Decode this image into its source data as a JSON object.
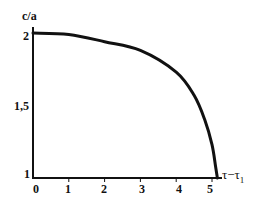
{
  "chart_data": {
    "type": "line",
    "title": "",
    "xlabel": "τ−τ1",
    "ylabel": "c/a",
    "xlim": [
      0,
      5.3
    ],
    "ylim": [
      1,
      2
    ],
    "x_ticks": [
      "0",
      "1",
      "2",
      "3",
      "4",
      "5"
    ],
    "y_ticks": [
      "1",
      "1,5",
      "2"
    ],
    "grid": false,
    "legend": null,
    "series": [
      {
        "name": "c/a",
        "color": "#111111",
        "x": [
          0,
          1,
          2,
          3,
          4,
          4.5,
          4.8,
          5.0,
          5.1,
          5.15
        ],
        "y": [
          2.0,
          1.99,
          1.94,
          1.88,
          1.73,
          1.57,
          1.4,
          1.23,
          1.08,
          1.0
        ]
      }
    ]
  },
  "axes": {
    "ylabel": "c/a",
    "xlabel_main": "τ−τ",
    "xlabel_sub": "1",
    "yticks": [
      {
        "label": "2",
        "value": 2
      },
      {
        "label": "1,5",
        "value": 1.5
      },
      {
        "label": "1",
        "value": 1
      }
    ],
    "xticks": [
      {
        "label": "0",
        "value": 0
      },
      {
        "label": "1",
        "value": 1
      },
      {
        "label": "2",
        "value": 2
      },
      {
        "label": "3",
        "value": 3
      },
      {
        "label": "4",
        "value": 4
      },
      {
        "label": "5",
        "value": 5
      }
    ]
  }
}
